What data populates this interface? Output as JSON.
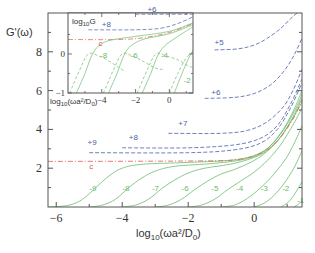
{
  "chart_data": {
    "type": "line",
    "title": "",
    "xlabel": "log10(ωa²/D0)",
    "ylabel": "G'(ω)",
    "xlim": [
      -6.25,
      1.45
    ],
    "ylim": [
      0,
      10
    ],
    "x_ticks": [
      "-6",
      "-4",
      "-2",
      "0"
    ],
    "y_ticks": [
      "2",
      "4",
      "6",
      "8"
    ],
    "grid": false,
    "legend": "none (curves labeled inline)",
    "colors": {
      "solid": "#6dbb6d",
      "dashed": "#4a5fa8",
      "critical": "#e0584a",
      "frame": "#555555"
    },
    "series": [
      {
        "name": "-9",
        "style": "solid-green",
        "points": [
          [
            -6.2,
            0.0
          ],
          [
            -5.6,
            0.1
          ],
          [
            -5.2,
            0.4
          ],
          [
            -4.8,
            1.0
          ],
          [
            -4.4,
            1.6
          ],
          [
            -4.0,
            2.0
          ],
          [
            -3.4,
            2.2
          ],
          [
            -2.0,
            2.3
          ],
          [
            -0.5,
            2.45
          ],
          [
            0.3,
            2.9
          ],
          [
            0.8,
            3.8
          ],
          [
            1.2,
            5.0
          ],
          [
            1.45,
            6.0
          ]
        ]
      },
      {
        "name": "-8",
        "style": "solid-green",
        "points": [
          [
            -5.0,
            0.0
          ],
          [
            -4.6,
            0.1
          ],
          [
            -4.2,
            0.4
          ],
          [
            -3.8,
            1.0
          ],
          [
            -3.4,
            1.5
          ],
          [
            -3.0,
            1.85
          ],
          [
            -2.4,
            2.1
          ],
          [
            -1.2,
            2.25
          ],
          [
            -0.2,
            2.5
          ],
          [
            0.4,
            3.0
          ],
          [
            0.9,
            4.0
          ],
          [
            1.3,
            5.2
          ],
          [
            1.45,
            5.8
          ]
        ]
      },
      {
        "name": "-7",
        "style": "solid-green",
        "points": [
          [
            -4.0,
            0.0
          ],
          [
            -3.6,
            0.1
          ],
          [
            -3.2,
            0.4
          ],
          [
            -2.8,
            0.95
          ],
          [
            -2.4,
            1.4
          ],
          [
            -2.0,
            1.75
          ],
          [
            -1.5,
            2.0
          ],
          [
            -0.6,
            2.25
          ],
          [
            0.2,
            2.7
          ],
          [
            0.7,
            3.4
          ],
          [
            1.1,
            4.4
          ],
          [
            1.45,
            5.6
          ]
        ]
      },
      {
        "name": "-6",
        "style": "solid-green",
        "points": [
          [
            -3.0,
            0.0
          ],
          [
            -2.6,
            0.1
          ],
          [
            -2.2,
            0.4
          ],
          [
            -1.8,
            0.9
          ],
          [
            -1.4,
            1.35
          ],
          [
            -1.0,
            1.7
          ],
          [
            -0.5,
            2.0
          ],
          [
            0.1,
            2.5
          ],
          [
            0.6,
            3.2
          ],
          [
            1.0,
            4.1
          ],
          [
            1.45,
            5.4
          ]
        ]
      },
      {
        "name": "-5",
        "style": "solid-green",
        "points": [
          [
            -2.0,
            0.0
          ],
          [
            -1.6,
            0.1
          ],
          [
            -1.2,
            0.4
          ],
          [
            -0.8,
            0.9
          ],
          [
            -0.4,
            1.35
          ],
          [
            0.0,
            1.8
          ],
          [
            0.4,
            2.4
          ],
          [
            0.8,
            3.2
          ],
          [
            1.2,
            4.3
          ],
          [
            1.45,
            5.1
          ]
        ]
      },
      {
        "name": "-4",
        "style": "solid-green",
        "points": [
          [
            -1.0,
            0.0
          ],
          [
            -0.6,
            0.1
          ],
          [
            -0.2,
            0.45
          ],
          [
            0.2,
            1.0
          ],
          [
            0.6,
            1.7
          ],
          [
            1.0,
            2.6
          ],
          [
            1.3,
            3.6
          ],
          [
            1.45,
            4.2
          ]
        ]
      },
      {
        "name": "-3",
        "style": "solid-green",
        "points": [
          [
            0.0,
            0.0
          ],
          [
            0.3,
            0.2
          ],
          [
            0.6,
            0.6
          ],
          [
            0.9,
            1.2
          ],
          [
            1.2,
            2.0
          ],
          [
            1.45,
            2.9
          ]
        ]
      },
      {
        "name": "-2",
        "style": "solid-green",
        "points": [
          [
            0.8,
            0.0
          ],
          [
            1.0,
            0.2
          ],
          [
            1.2,
            0.6
          ],
          [
            1.45,
            1.3
          ]
        ]
      },
      {
        "name": "-1",
        "style": "solid-green",
        "points": [
          [
            1.2,
            0.0
          ],
          [
            1.35,
            0.15
          ],
          [
            1.45,
            0.35
          ]
        ]
      },
      {
        "name": "c",
        "style": "dashdot-red",
        "points": [
          [
            -6.25,
            2.35
          ],
          [
            -2.0,
            2.37
          ],
          [
            -0.5,
            2.45
          ],
          [
            0.3,
            2.85
          ],
          [
            0.8,
            3.6
          ],
          [
            1.2,
            4.6
          ],
          [
            1.45,
            5.5
          ]
        ]
      },
      {
        "name": "+9",
        "style": "dashed-blue",
        "points": [
          [
            -5.0,
            2.8
          ],
          [
            -2.0,
            2.8
          ],
          [
            -0.6,
            2.95
          ],
          [
            0.2,
            3.3
          ],
          [
            0.7,
            4.0
          ],
          [
            1.1,
            5.1
          ],
          [
            1.45,
            6.4
          ]
        ]
      },
      {
        "name": "+8",
        "style": "dashed-blue",
        "points": [
          [
            -4.0,
            3.05
          ],
          [
            -2.0,
            3.05
          ],
          [
            -0.6,
            3.2
          ],
          [
            0.2,
            3.55
          ],
          [
            0.7,
            4.2
          ],
          [
            1.1,
            5.3
          ],
          [
            1.45,
            6.6
          ]
        ]
      },
      {
        "name": "+7",
        "style": "dashed-blue",
        "points": [
          [
            -2.6,
            3.8
          ],
          [
            -1.0,
            3.8
          ],
          [
            -0.2,
            3.95
          ],
          [
            0.4,
            4.4
          ],
          [
            0.9,
            5.2
          ],
          [
            1.2,
            6.1
          ],
          [
            1.45,
            7.1
          ]
        ]
      },
      {
        "name": "+6",
        "style": "dashed-blue",
        "points": [
          [
            -1.5,
            5.6
          ],
          [
            -0.6,
            5.65
          ],
          [
            0.0,
            5.85
          ],
          [
            0.5,
            6.3
          ],
          [
            0.9,
            7.0
          ],
          [
            1.2,
            7.8
          ],
          [
            1.45,
            8.7
          ]
        ]
      },
      {
        "name": "+5",
        "style": "dashed-blue",
        "points": [
          [
            -1.2,
            8.1
          ],
          [
            -0.5,
            8.15
          ],
          [
            0.0,
            8.35
          ],
          [
            0.4,
            8.7
          ],
          [
            0.8,
            9.2
          ],
          [
            1.1,
            9.7
          ],
          [
            1.3,
            10.0
          ]
        ]
      }
    ],
    "inset": {
      "type": "line",
      "ylabel": "log10G",
      "xlabel": "log10(ωa²/D0)",
      "xlim": [
        -6,
        1.4
      ],
      "ylim": [
        -1,
        1.05
      ],
      "x_ticks": [
        "-4",
        "-2",
        "0"
      ],
      "y_ticks": [
        "-1",
        "0"
      ],
      "series": [
        {
          "name": "+8",
          "style": "dashed-blue",
          "points": [
            [
              -4.8,
              0.62
            ],
            [
              -2.0,
              0.62
            ],
            [
              -0.5,
              0.66
            ],
            [
              0.5,
              0.78
            ],
            [
              1.4,
              0.95
            ]
          ]
        },
        {
          "name": "+6",
          "style": "dashed-blue",
          "points": [
            [
              -2.0,
              1.02
            ],
            [
              1.4,
              1.02
            ]
          ]
        },
        {
          "name": "c",
          "style": "dashdot-red",
          "points": [
            [
              -6.0,
              0.37
            ],
            [
              -3.0,
              0.37
            ],
            [
              -1.5,
              0.42
            ],
            [
              0.0,
              0.55
            ],
            [
              1.4,
              0.78
            ]
          ]
        },
        {
          "name": "-8 G'",
          "style": "solid-green",
          "points": [
            [
              -5.5,
              -1.0
            ],
            [
              -5.0,
              -0.5
            ],
            [
              -4.6,
              -0.05
            ],
            [
              -4.2,
              0.2
            ],
            [
              -3.5,
              0.35
            ],
            [
              -2.0,
              0.45
            ],
            [
              0.0,
              0.58
            ],
            [
              1.4,
              0.8
            ]
          ]
        },
        {
          "name": "-8 G''",
          "style": "dashed-green",
          "points": [
            [
              -5.9,
              -1.0
            ],
            [
              -5.3,
              -0.4
            ],
            [
              -4.8,
              0.0
            ],
            [
              -4.2,
              -0.05
            ],
            [
              -3.5,
              -0.2
            ],
            [
              -3.0,
              -0.35
            ],
            [
              -2.6,
              -0.45
            ]
          ]
        },
        {
          "name": "-6 G'",
          "style": "solid-green",
          "points": [
            [
              -3.6,
              -1.0
            ],
            [
              -3.1,
              -0.5
            ],
            [
              -2.7,
              -0.05
            ],
            [
              -2.3,
              0.2
            ],
            [
              -1.5,
              0.38
            ],
            [
              0.0,
              0.52
            ],
            [
              1.4,
              0.75
            ]
          ]
        },
        {
          "name": "-6 G''",
          "style": "dashed-green",
          "points": [
            [
              -3.9,
              -1.0
            ],
            [
              -3.3,
              -0.4
            ],
            [
              -2.8,
              0.0
            ],
            [
              -2.2,
              -0.05
            ],
            [
              -1.5,
              -0.2
            ],
            [
              -0.9,
              -0.35
            ],
            [
              -0.4,
              -0.4
            ]
          ]
        },
        {
          "name": "-4 G'",
          "style": "solid-green",
          "points": [
            [
              -1.6,
              -1.0
            ],
            [
              -1.1,
              -0.5
            ],
            [
              -0.7,
              -0.05
            ],
            [
              -0.3,
              0.2
            ],
            [
              0.4,
              0.42
            ],
            [
              1.4,
              0.7
            ]
          ]
        },
        {
          "name": "-4 G''",
          "style": "dashed-green",
          "points": [
            [
              -1.9,
              -1.0
            ],
            [
              -1.3,
              -0.4
            ],
            [
              -0.8,
              0.0
            ],
            [
              -0.2,
              -0.05
            ],
            [
              0.5,
              -0.15
            ],
            [
              1.1,
              -0.3
            ],
            [
              1.4,
              -0.35
            ]
          ]
        },
        {
          "name": "-2 G'",
          "style": "solid-green",
          "points": [
            [
              0.3,
              -1.0
            ],
            [
              0.7,
              -0.55
            ],
            [
              1.1,
              -0.15
            ],
            [
              1.4,
              0.1
            ]
          ]
        },
        {
          "name": "-2 G''",
          "style": "dashed-green",
          "points": [
            [
              0.0,
              -1.0
            ],
            [
              0.5,
              -0.5
            ],
            [
              1.0,
              -0.1
            ],
            [
              1.4,
              0.05
            ]
          ]
        }
      ]
    }
  },
  "axes": {
    "ylabel": "G'(ω)",
    "xlabel_main": "log",
    "xlabel_sub": "10",
    "xlabel_rest": "(ωa²/D",
    "xlabel_sub2": "0",
    "xlabel_end": ")",
    "x_ticks": [
      "−6",
      "−4",
      "−2",
      "0"
    ],
    "y_ticks": [
      "2",
      "4",
      "6",
      "8"
    ]
  },
  "inset_axes": {
    "ylabel_main": "log",
    "ylabel_sub": "10",
    "ylabel_end": "G",
    "xlabel_main": "log",
    "xlabel_sub": "10",
    "xlabel_rest": "(ωa²/D",
    "xlabel_sub2": "0",
    "xlabel_end": ")",
    "x_ticks": [
      "−4",
      "−2",
      "0"
    ],
    "y_ticks": [
      "0",
      "−1"
    ]
  },
  "curve_labels": {
    "main": [
      {
        "text": "-9",
        "x": -5.0,
        "y": 0.8,
        "color": "#6dbb6d"
      },
      {
        "text": "-8",
        "x": -4.0,
        "y": 0.8,
        "color": "#6dbb6d"
      },
      {
        "text": "-7",
        "x": -3.1,
        "y": 0.8,
        "color": "#6dbb6d"
      },
      {
        "text": "-6",
        "x": -2.2,
        "y": 0.8,
        "color": "#6dbb6d"
      },
      {
        "text": "-5",
        "x": -1.3,
        "y": 0.8,
        "color": "#6dbb6d"
      },
      {
        "text": "-4",
        "x": -0.55,
        "y": 0.8,
        "color": "#6dbb6d"
      },
      {
        "text": "-3",
        "x": 0.2,
        "y": 0.8,
        "color": "#6dbb6d"
      },
      {
        "text": "-2",
        "x": 0.85,
        "y": 0.8,
        "color": "#6dbb6d"
      },
      {
        "text": "-1",
        "x": 1.3,
        "y": 0.2,
        "color": "#6dbb6d"
      },
      {
        "text": "c",
        "x": -5.0,
        "y": 1.95,
        "color": "#e0584a"
      },
      {
        "text": "+9",
        "x": -5.05,
        "y": 3.2,
        "color": "#4a5fa8"
      },
      {
        "text": "+8",
        "x": -3.8,
        "y": 3.45,
        "color": "#4a5fa8"
      },
      {
        "text": "+7",
        "x": -2.3,
        "y": 4.15,
        "color": "#4a5fa8"
      },
      {
        "text": "+6",
        "x": -1.3,
        "y": 5.75,
        "color": "#4a5fa8"
      },
      {
        "text": "+5",
        "x": -1.2,
        "y": 8.35,
        "color": "#4a5fa8"
      }
    ],
    "inset": [
      {
        "text": "+8",
        "x": -4.0,
        "y": 0.7,
        "color": "#4a5fa8"
      },
      {
        "text": "+6",
        "x": -1.3,
        "y": 1.08,
        "color": "#4a5fa8"
      },
      {
        "text": "c",
        "x": -4.2,
        "y": 0.2,
        "color": "#e0584a"
      },
      {
        "text": "-8",
        "x": -4.1,
        "y": -0.1,
        "color": "#6dbb6d"
      },
      {
        "text": "-6",
        "x": -2.3,
        "y": -0.1,
        "color": "#6dbb6d"
      },
      {
        "text": "-4",
        "x": -0.5,
        "y": -0.1,
        "color": "#6dbb6d"
      },
      {
        "text": "-2",
        "x": 0.85,
        "y": -0.75,
        "color": "#6dbb6d"
      }
    ]
  }
}
